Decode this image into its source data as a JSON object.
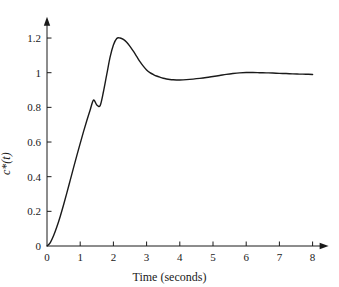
{
  "chart_data": {
    "type": "line",
    "title": "",
    "subtitle": "",
    "xlabel": "Time (seconds)",
    "ylabel": "c*(t)",
    "xlim": [
      0,
      8
    ],
    "ylim": [
      0,
      1.3
    ],
    "grid": false,
    "legend": null,
    "xticks": [
      "0",
      "1",
      "2",
      "3",
      "4",
      "5",
      "6",
      "7",
      "8"
    ],
    "xtick_values": [
      0,
      1,
      2,
      3,
      4,
      5,
      6,
      7,
      8
    ],
    "yticks": [
      "0",
      "0.2",
      "0.4",
      "0.6",
      "0.8",
      "1",
      "1.2"
    ],
    "ytick_values": [
      0,
      0.2,
      0.4,
      0.6,
      0.8,
      1.0,
      1.2
    ],
    "axis_arrows": {
      "x": "right-arrowhead",
      "y": "up-arrowhead"
    },
    "line_color": "#1a1a1a",
    "line_width": 1.4,
    "background_color": "#ffffff",
    "series": [
      {
        "name": "c*(t)",
        "x": [
          0.0,
          0.1,
          0.2,
          0.3,
          0.4,
          0.5,
          0.6,
          0.7,
          0.8,
          0.9,
          1.0,
          1.1,
          1.2,
          1.3,
          1.4,
          1.5,
          1.6,
          1.7,
          1.8,
          1.9,
          2.0,
          2.1,
          2.2,
          2.3,
          2.4,
          2.5,
          2.6,
          2.7,
          2.8,
          2.9,
          3.0,
          3.1,
          3.2,
          3.3,
          3.4,
          3.5,
          3.6,
          3.7,
          3.8,
          3.9,
          4.0,
          4.2,
          4.4,
          4.6,
          4.8,
          5.0,
          5.2,
          5.4,
          5.6,
          5.8,
          6.0,
          6.2,
          6.4,
          6.6,
          6.8,
          7.0,
          7.2,
          7.4,
          7.6,
          7.8,
          8.0
        ],
        "y": [
          0.0,
          0.02,
          0.06,
          0.112,
          0.172,
          0.238,
          0.308,
          0.38,
          0.452,
          0.523,
          0.592,
          0.66,
          0.724,
          0.785,
          0.842,
          0.814,
          0.81,
          0.89,
          0.99,
          1.09,
          1.16,
          1.198,
          1.2,
          1.192,
          1.176,
          1.152,
          1.124,
          1.094,
          1.064,
          1.038,
          1.016,
          1.0,
          0.99,
          0.981,
          0.974,
          0.968,
          0.964,
          0.961,
          0.959,
          0.958,
          0.958,
          0.96,
          0.963,
          0.967,
          0.972,
          0.978,
          0.984,
          0.99,
          0.995,
          0.999,
          1.001,
          1.001,
          1.0,
          0.999,
          0.998,
          0.996,
          0.995,
          0.993,
          0.992,
          0.991,
          0.99
        ],
        "features": {
          "start_value": 0,
          "peak_value": 1.2,
          "peak_time": 2.1,
          "trough_value": 0.958,
          "trough_time": 4.0,
          "second_peak_value": 1.001,
          "second_peak_time": 6.1,
          "final_value": 0.99,
          "steady_state": 1.0
        }
      }
    ]
  },
  "figure": {
    "name": "step-response-plot"
  }
}
